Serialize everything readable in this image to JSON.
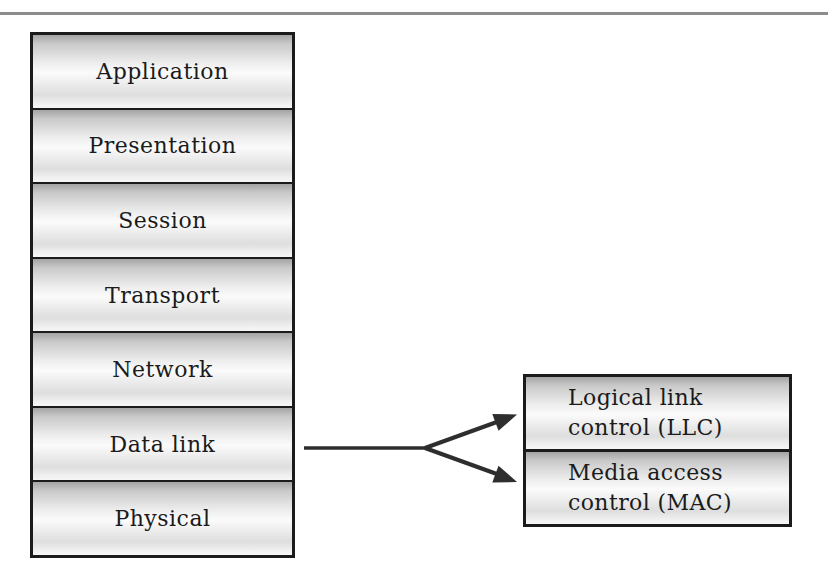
{
  "page": {
    "background": "#ffffff",
    "top_rule_color": "#8c8c8c",
    "box_border_color": "#1b1b1b",
    "text_color": "#1b1b1b"
  },
  "osi_stack": {
    "layers": [
      "Application",
      "Presentation",
      "Session",
      "Transport",
      "Network",
      "Data link",
      "Physical"
    ]
  },
  "sublayer_box": {
    "cells": [
      {
        "line1": "Logical link",
        "line2": "control (LLC)"
      },
      {
        "line1": "Media access",
        "line2": "control (MAC)"
      }
    ]
  },
  "connector": {
    "name": "fork-arrow",
    "from_layer": "Data link",
    "color": "#2e2e2e"
  }
}
